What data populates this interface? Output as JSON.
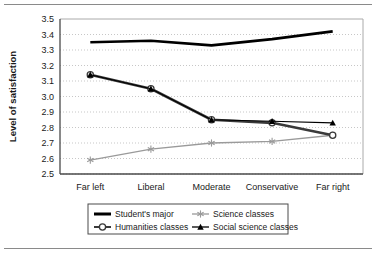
{
  "figure": {
    "has_top_rule": true,
    "has_bottom_rule": true,
    "background": "#ffffff"
  },
  "chart_data": {
    "type": "line",
    "title": "",
    "xlabel": "",
    "ylabel": "Level of satisfaction",
    "categories": [
      "Far left",
      "Liberal",
      "Moderate",
      "Conservative",
      "Far right"
    ],
    "ylim": [
      2.5,
      3.5
    ],
    "ytick_step": 0.1,
    "yticks": [
      "3.5",
      "3.4",
      "3.3",
      "3.2",
      "3.1",
      "3.0",
      "2.9",
      "2.8",
      "2.7",
      "2.6",
      "2.5"
    ],
    "grid": "horizontal-dotted",
    "legend_position": "bottom",
    "series": [
      {
        "name": "Student's major",
        "values": [
          3.35,
          3.36,
          3.33,
          3.37,
          3.42
        ],
        "color": "#000000",
        "width": 2.6,
        "marker": "none"
      },
      {
        "name": "Humanities classes",
        "values": [
          3.14,
          3.05,
          2.85,
          2.83,
          2.75
        ],
        "color": "#3a3a3a",
        "width": 2.6,
        "marker": "circle"
      },
      {
        "name": "Science classes",
        "values": [
          2.59,
          2.66,
          2.7,
          2.71,
          2.75
        ],
        "color": "#9a9a9a",
        "width": 1.3,
        "marker": "asterisk"
      },
      {
        "name": "Social science classes",
        "values": [
          3.14,
          3.05,
          2.85,
          2.84,
          2.83
        ],
        "color": "#000000",
        "width": 1.1,
        "marker": "triangle"
      }
    ]
  },
  "legend": {
    "entries": [
      {
        "label": "Student's major",
        "marker": "none",
        "color": "#000000",
        "width": 3.0
      },
      {
        "label": "Science classes",
        "marker": "asterisk",
        "color": "#9a9a9a",
        "width": 1.3
      },
      {
        "label": "Humanities classes",
        "marker": "circle",
        "color": "#3a3a3a",
        "width": 2.0
      },
      {
        "label": "Social science classes",
        "marker": "triangle",
        "color": "#000000",
        "width": 1.3
      }
    ]
  }
}
